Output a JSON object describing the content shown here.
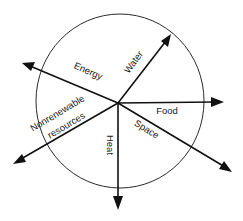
{
  "diagram": {
    "type": "radial-arrow-diagram",
    "center": {
      "x": 118,
      "y": 103
    },
    "circle": {
      "cx": 120,
      "cy": 101,
      "rx": 84,
      "ry": 87
    },
    "colors": {
      "line": "#111111",
      "circle": "#2a2a2a",
      "text": "#1a1a1a",
      "background": "#ffffff"
    },
    "arrows": [
      {
        "id": "energy",
        "label": "Energy",
        "tip": {
          "x": 22,
          "y": 63
        }
      },
      {
        "id": "water",
        "label": "Water",
        "tip": {
          "x": 171,
          "y": 34
        }
      },
      {
        "id": "food",
        "label": "Food",
        "tip": {
          "x": 224,
          "y": 102
        }
      },
      {
        "id": "space",
        "label": "Space",
        "tip": {
          "x": 232,
          "y": 172
        }
      },
      {
        "id": "heat",
        "label": "Heat",
        "tip": {
          "x": 118,
          "y": 210
        }
      },
      {
        "id": "nonrenewable",
        "label_line1": "Nonrenewable",
        "label_line2": "resources",
        "tip": {
          "x": 13,
          "y": 164
        }
      }
    ]
  }
}
